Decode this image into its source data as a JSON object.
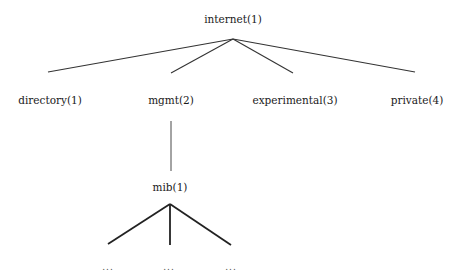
{
  "diagram": {
    "type": "tree",
    "title": "",
    "root": {
      "label": "internet(1)",
      "children": [
        {
          "label": "directory(1)"
        },
        {
          "label": "mgmt(2)",
          "children": [
            {
              "label": "mib(1)",
              "children": [
                {
                  "label": "..."
                },
                {
                  "label": "..."
                },
                {
                  "label": "..."
                }
              ]
            }
          ]
        },
        {
          "label": "experimental(3)"
        },
        {
          "label": "private(4)"
        }
      ]
    },
    "nodes": {
      "internet": "internet(1)",
      "directory": "directory(1)",
      "mgmt": "mgmt(2)",
      "experimental": "experimental(3)",
      "private": "private(4)",
      "mib": "mib(1)",
      "mib_child_1": "...",
      "mib_child_2": "...",
      "mib_child_3": "..."
    },
    "colors": {
      "line": "#222222",
      "text": "#1a1a1a"
    }
  }
}
